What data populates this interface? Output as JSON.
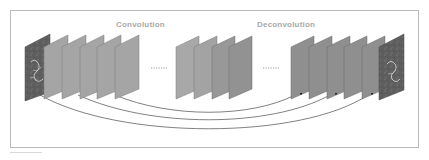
{
  "figure": {
    "labels": {
      "encoder": "Convolution",
      "decoder": "Deconvolution"
    },
    "ellipsis": "······",
    "encoder_layers": 5,
    "middle_layers": 4,
    "decoder_layers": 5,
    "skip_connections": 3,
    "input": "input-image",
    "output": "output-image",
    "colors": {
      "panel_light": "#a7a7a7",
      "panel_mid": "#9a9a9a",
      "panel_dark": "#8e8e8e",
      "panel_edge": "#6f6f6f",
      "image_dark": "#5c5c5c",
      "connection": "#4a4a4a",
      "label": "#a9a9a9",
      "frame": "#b9b9b9"
    }
  }
}
